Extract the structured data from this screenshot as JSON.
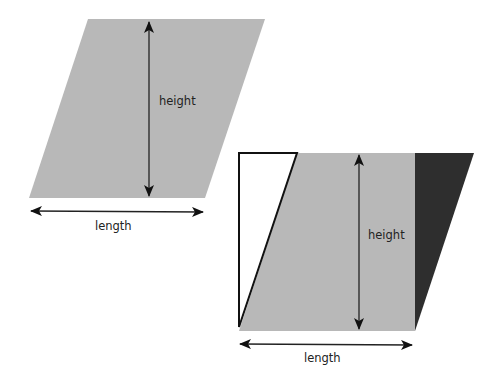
{
  "colors": {
    "background": "#ffffff",
    "shape_fill": "#b8b8b8",
    "dark_triangle": "#2e2e2e",
    "white_triangle": "#ffffff",
    "arrow": "#111111"
  },
  "figure_1": {
    "name": "parallelogram",
    "height_label": "height",
    "length_label": "length"
  },
  "figure_2": {
    "name": "parallelogram-rearranged-to-rectangle",
    "height_label": "height",
    "length_label": "length"
  }
}
